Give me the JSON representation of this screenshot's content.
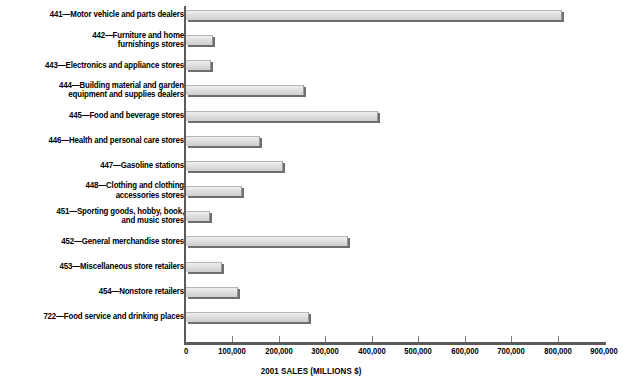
{
  "chart_data": {
    "type": "bar",
    "orientation": "horizontal",
    "title": "",
    "xlabel": "2001 SALES (MILLIONS $)",
    "ylabel": "",
    "xlim": [
      0,
      900000
    ],
    "xtick_step": 100000,
    "grid": false,
    "legend": null,
    "axis_tick_labels": [
      "0",
      "100,000",
      "200,000",
      "300,000",
      "400,000",
      "500,000",
      "600,000",
      "700,000",
      "800,000",
      "900,000"
    ],
    "categories": [
      "441—Motor vehicle and parts dealers",
      "442—Furniture and home\nfurnishings stores",
      "443—Electronics and appliance stores",
      "444—Building material and garden\nequipment and supplies dealers",
      "445—Food and beverage stores",
      "446—Health and personal care stores",
      "447—Gasoline stations",
      "448—Clothing and clothing\naccessories stores",
      "451—Sporting goods, hobby, book,\nand music stores",
      "452—General merchandise stores",
      "453—Miscellaneous store retailers",
      "454—Nonstore retailers",
      "722—Food service and drinking places"
    ],
    "values": [
      810000,
      58000,
      54000,
      254000,
      413000,
      159000,
      209000,
      121000,
      52000,
      349000,
      78000,
      112000,
      265000
    ],
    "bar_color": "#dedede",
    "axis_color": "#5b5b5b",
    "text_color": "#000000",
    "background": "#ffffff"
  }
}
